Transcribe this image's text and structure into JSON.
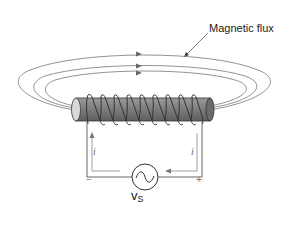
{
  "diagram": {
    "labels": {
      "flux": "Magnetic flux",
      "current_left": "i",
      "current_right": "i",
      "minus": "−",
      "plus": "+",
      "source_main": "v",
      "source_sub": "S"
    },
    "components": {
      "core": "iron core cylinder",
      "coil_turns": 10,
      "source": "AC voltage source",
      "flux_loops": 3
    },
    "colors": {
      "line": "#555555",
      "core_fill": "#888888",
      "core_dark": "#666666",
      "coil": "#333333",
      "text": "#222222"
    }
  }
}
